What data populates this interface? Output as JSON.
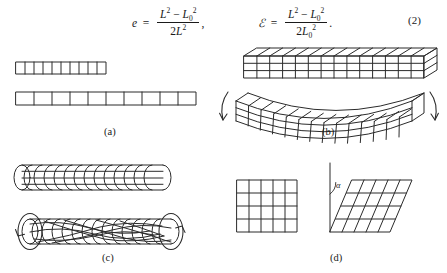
{
  "figure": {
    "equation_number": "(2)",
    "equations": [
      {
        "id": "eq-e",
        "lhs": "e",
        "numerator": "L² − L₀²",
        "denominator": "2L²",
        "trailing": ",",
        "full_text": "e = (L² − L₀²) / (2L²),"
      },
      {
        "id": "eq-E",
        "lhs": "ℰ",
        "numerator": "L² − L₀²",
        "denominator": "2L₀²",
        "trailing": ".",
        "full_text": "ℰ = (L² − L₀²) / (2L₀²)."
      }
    ],
    "symbols": {
      "length_current": "L",
      "length_reference": "L₀",
      "eulerian_strain": "e",
      "lagrangian_strain": "ℰ",
      "shear_angle": "α",
      "exponent_two": "2",
      "subscript_zero": "0"
    },
    "panels": [
      {
        "id": "a",
        "label": "(a)",
        "deformation": "uniaxial extension",
        "undeformed": {
          "name": "short-bar",
          "cells": 10
        },
        "deformed": {
          "name": "stretched-bar",
          "cells": 10
        },
        "arrows": 0
      },
      {
        "id": "b",
        "label": "(b)",
        "deformation": "bending",
        "undeformed": {
          "name": "straight-beam",
          "cells_long": 14,
          "cells_high": 3
        },
        "deformed": {
          "name": "bent-beam",
          "cells_long": 14,
          "cells_high": 3
        },
        "arrows": 2
      },
      {
        "id": "c",
        "label": "(c)",
        "deformation": "torsion",
        "undeformed": {
          "name": "straight-cylinder",
          "rings": 14
        },
        "deformed": {
          "name": "twisted-cylinder",
          "rings": 14
        },
        "arrows": 2
      },
      {
        "id": "d",
        "label": "(d)",
        "deformation": "simple shear",
        "undeformed": {
          "name": "square-grid",
          "cols": 5,
          "rows": 4
        },
        "deformed": {
          "name": "sheared-grid",
          "cols": 5,
          "rows": 4,
          "angle_label": "α"
        },
        "arrows": 0
      }
    ],
    "colors": {
      "ink": "#1a1a1a",
      "line": "#2b2b2b",
      "background": "#ffffff"
    }
  }
}
